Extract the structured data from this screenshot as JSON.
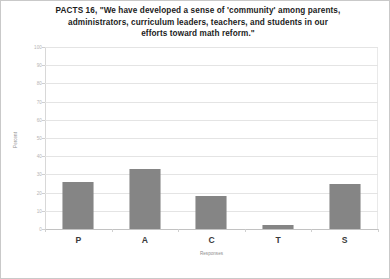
{
  "chart_data": {
    "type": "bar",
    "title": "PACTS 16, \"We have developed a sense of 'community' among parents, administrators, curriculum leaders, teachers, and students in our efforts toward math reform.\"",
    "title_lines": [
      "PACTS 16, \"We have developed a sense of 'community' among parents,",
      "administrators, curriculum leaders, teachers, and students in our",
      "efforts toward math reform.\""
    ],
    "categories": [
      "P",
      "A",
      "C",
      "T",
      "S"
    ],
    "values": [
      26,
      33,
      18,
      2,
      25
    ],
    "xlabel": "Responses",
    "ylabel": "Percent",
    "ylim": [
      0,
      100
    ],
    "ytick_labels": [
      "0",
      "10",
      "20",
      "30",
      "40",
      "50",
      "60",
      "70",
      "80",
      "90",
      "100"
    ],
    "ytick_values": [
      0,
      10,
      20,
      30,
      40,
      50,
      60,
      70,
      80,
      90,
      100
    ],
    "grid": "horizontal",
    "legend": "none",
    "bar_color": "#6f6f6f",
    "bar_pattern": "checkered-dither",
    "background_color": "#ffffff",
    "border_color": "#c9c9c9"
  }
}
